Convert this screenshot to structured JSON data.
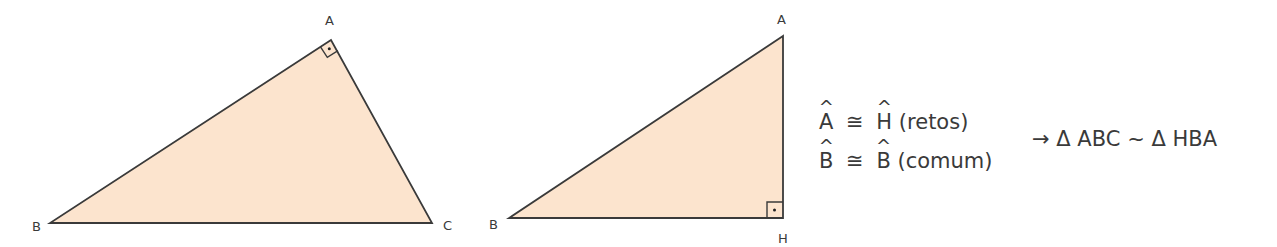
{
  "colors": {
    "triangle_fill": "#FCE4CE",
    "stroke": "#3a3a3a",
    "text": "#3a3a3a",
    "background": "#ffffff"
  },
  "figure1": {
    "name": "triangle ABC",
    "vertices": {
      "A": {
        "label": "A",
        "x": 331,
        "y": 40
      },
      "B": {
        "label": "B",
        "x": 50,
        "y": 223
      },
      "C": {
        "label": "C",
        "x": 432,
        "y": 223
      }
    },
    "right_angle_at": "A"
  },
  "figure2": {
    "name": "triangle HBA",
    "vertices": {
      "A": {
        "label": "A",
        "x": 783,
        "y": 36
      },
      "B": {
        "label": "B",
        "x": 509,
        "y": 218
      },
      "H": {
        "label": "H",
        "x": 783,
        "y": 218
      }
    },
    "right_angle_at": "H"
  },
  "equations": {
    "line1": {
      "left_angle": "A",
      "relation": "≅",
      "right_angle": "H",
      "note": "(retos)"
    },
    "line2": {
      "left_angle": "B",
      "relation": "≅",
      "right_angle": "B",
      "note": "(comum)"
    },
    "conclusion": {
      "arrow": "→",
      "delta1": "Δ",
      "tri1": "ABC",
      "similar": "~",
      "delta2": "Δ",
      "tri2": "HBA"
    }
  }
}
